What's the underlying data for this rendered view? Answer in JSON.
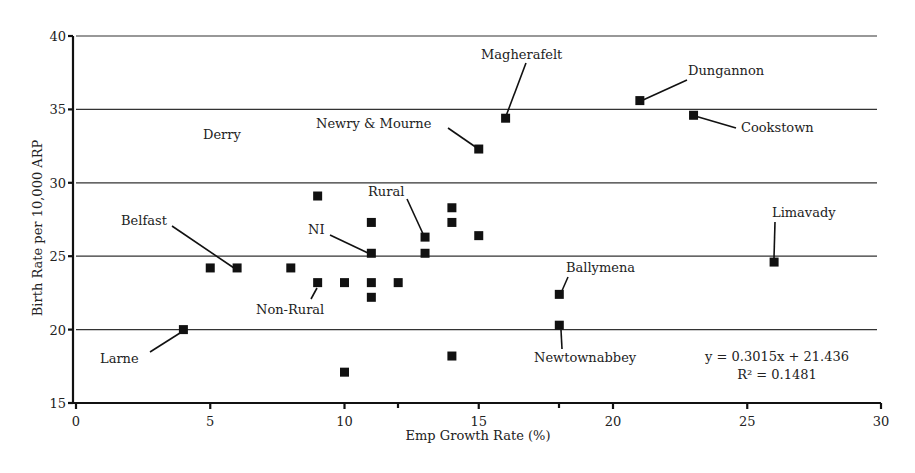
{
  "chart_data": {
    "type": "scatter",
    "title": "",
    "xlabel": "Emp Growth Rate (%)",
    "ylabel": "Birth Rate per 10,000 ARP",
    "xlim": [
      0,
      30
    ],
    "ylim": [
      15,
      40
    ],
    "xticks": [
      0,
      5,
      10,
      15,
      20,
      25,
      30
    ],
    "yticks": [
      15,
      20,
      25,
      30,
      35,
      40
    ],
    "grid": "horizontal",
    "legend": null,
    "marker": "square",
    "points": [
      {
        "x": 4,
        "y": 20.0,
        "label": "Larne"
      },
      {
        "x": 5,
        "y": 24.2,
        "label": ""
      },
      {
        "x": 6,
        "y": 24.2,
        "label": "Belfast"
      },
      {
        "x": 8,
        "y": 24.2,
        "label": ""
      },
      {
        "x": 9,
        "y": 29.1,
        "label": ""
      },
      {
        "x": 9,
        "y": 23.2,
        "label": "Non-Rural"
      },
      {
        "x": 10,
        "y": 23.2,
        "label": ""
      },
      {
        "x": 10,
        "y": 17.1,
        "label": ""
      },
      {
        "x": 11,
        "y": 27.3,
        "label": ""
      },
      {
        "x": 11,
        "y": 25.2,
        "label": "NI"
      },
      {
        "x": 11,
        "y": 23.2,
        "label": ""
      },
      {
        "x": 11,
        "y": 22.2,
        "label": ""
      },
      {
        "x": 12,
        "y": 23.2,
        "label": ""
      },
      {
        "x": 13,
        "y": 26.3,
        "label": "Rural"
      },
      {
        "x": 13,
        "y": 25.2,
        "label": ""
      },
      {
        "x": 14,
        "y": 28.3,
        "label": ""
      },
      {
        "x": 14,
        "y": 27.3,
        "label": ""
      },
      {
        "x": 14,
        "y": 18.2,
        "label": ""
      },
      {
        "x": 15,
        "y": 32.3,
        "label": "Newry & Mourne"
      },
      {
        "x": 15,
        "y": 26.4,
        "label": ""
      },
      {
        "x": 16,
        "y": 34.4,
        "label": "Magherafelt"
      },
      {
        "x": 18,
        "y": 22.4,
        "label": "Ballymena"
      },
      {
        "x": 18,
        "y": 20.3,
        "label": "Newtownabbey"
      },
      {
        "x": 21,
        "y": 35.6,
        "label": "Dungannon"
      },
      {
        "x": 23,
        "y": 34.6,
        "label": "Cookstown"
      },
      {
        "x": 26,
        "y": 24.6,
        "label": "Limavady"
      }
    ],
    "annotations": [
      {
        "text": "Derry",
        "x": 5.5,
        "y": 33.3,
        "note": "label without marker"
      }
    ],
    "trendline": {
      "equation": "y = 0.3015x + 21.436",
      "r_squared": "R² = 0.1481",
      "slope": 0.3015,
      "intercept": 21.436,
      "r2": 0.1481,
      "drawn": false
    }
  },
  "labels": {
    "xlabel": "Emp Growth Rate (%)",
    "ylabel": "Birth Rate per 10,000 ARP",
    "equation": "y = 0.3015x + 21.436",
    "r2": "R² = 0.1481",
    "derry": "Derry"
  },
  "layout": {
    "x0": 76,
    "xscale": 26.85,
    "y0": 36,
    "yscale": 14.68,
    "grid_right": 877,
    "axis_right": 881,
    "marker_size": 9,
    "label_placements": {
      "Larne": {
        "tx": 100,
        "ty": 363,
        "anchor": "start",
        "lx1": 150,
        "ly1": 352,
        "lx2": 180,
        "ly2": 333
      },
      "Belfast": {
        "tx": 121,
        "ty": 225,
        "anchor": "start",
        "lx1": 172,
        "ly1": 226,
        "lx2": 234,
        "ly2": 268
      },
      "Non-Rural": {
        "tx": 256,
        "ty": 314,
        "anchor": "start",
        "lx1": 311,
        "ly1": 299,
        "lx2": 317,
        "ly2": 288
      },
      "NI": {
        "tx": 308,
        "ty": 234,
        "anchor": "start",
        "lx1": 330,
        "ly1": 235,
        "lx2": 368,
        "ly2": 253
      },
      "Rural": {
        "tx": 368,
        "ty": 196,
        "anchor": "start",
        "lx1": 407,
        "ly1": 199,
        "lx2": 424,
        "ly2": 236
      },
      "Newry & Mourne": {
        "tx": 316,
        "ty": 128,
        "anchor": "start",
        "lx1": 448,
        "ly1": 128,
        "lx2": 477,
        "ly2": 148
      },
      "Magherafelt": {
        "tx": 481,
        "ty": 59,
        "anchor": "start",
        "lx1": 526,
        "ly1": 63,
        "lx2": 506,
        "ly2": 116
      },
      "Ballymena": {
        "tx": 566,
        "ty": 272,
        "anchor": "start",
        "lx1": 568,
        "ly1": 277,
        "lx2": 561,
        "ly2": 293
      },
      "Newtownabbey": {
        "tx": 534,
        "ty": 362,
        "anchor": "start",
        "lx1": 561,
        "ly1": 330,
        "lx2": 562,
        "ly2": 349
      },
      "Dungannon": {
        "tx": 688,
        "ty": 75,
        "anchor": "start",
        "lx1": 687,
        "ly1": 80,
        "lx2": 643,
        "ly2": 100
      },
      "Cookstown": {
        "tx": 741,
        "ty": 132,
        "anchor": "start",
        "lx1": 736,
        "ly1": 128,
        "lx2": 695,
        "ly2": 116
      },
      "Limavady": {
        "tx": 772,
        "ty": 217,
        "anchor": "start",
        "lx1": 775,
        "ly1": 222,
        "lx2": 774,
        "ly2": 258
      }
    },
    "extra_ticks_x": [
      398,
      559
    ]
  }
}
